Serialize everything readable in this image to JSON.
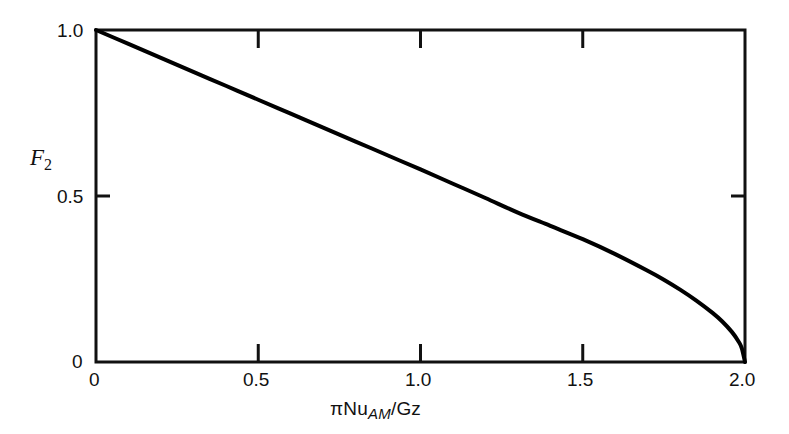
{
  "chart_data": {
    "type": "line",
    "title": "",
    "xlabel": "πNu_AM/Gz",
    "xlabel_parts": {
      "prefix": "πNu",
      "subscript": "AM",
      "suffix": "/Gz"
    },
    "ylabel": "F_2",
    "ylabel_parts": {
      "base": "F",
      "subscript": "2"
    },
    "xlim": [
      0,
      2.0
    ],
    "ylim": [
      0,
      1.0
    ],
    "xticks": [
      0,
      0.5,
      1.0,
      1.5,
      2.0
    ],
    "xticklabels": [
      "0",
      "0.5",
      "1.0",
      "1.5",
      "2.0"
    ],
    "yticks": [
      0,
      0.5,
      1.0
    ],
    "yticklabels": [
      "0",
      "0.5",
      "1.0"
    ],
    "grid": false,
    "legend": null,
    "frame": "box",
    "tick_direction": "in",
    "line_color": "#000000",
    "line_width": 4,
    "series": [
      {
        "name": "F2",
        "x": [
          0.0,
          0.1,
          0.2,
          0.3,
          0.4,
          0.5,
          0.6,
          0.7,
          0.8,
          0.9,
          1.0,
          1.1,
          1.2,
          1.3,
          1.4,
          1.5,
          1.6,
          1.7,
          1.75,
          1.8,
          1.85,
          1.9,
          1.93,
          1.96,
          1.98,
          1.99,
          2.0
        ],
        "y": [
          1.0,
          0.958,
          0.916,
          0.874,
          0.832,
          0.79,
          0.748,
          0.706,
          0.664,
          0.622,
          0.58,
          0.537,
          0.494,
          0.45,
          0.41,
          0.37,
          0.325,
          0.275,
          0.248,
          0.218,
          0.185,
          0.148,
          0.122,
          0.09,
          0.062,
          0.042,
          0.0
        ]
      }
    ]
  },
  "axes": {
    "x_tick_labels": [
      "0",
      "0.5",
      "1.0",
      "1.5",
      "2.0"
    ],
    "y_tick_labels": [
      "1.0",
      "0.5",
      "0"
    ]
  }
}
